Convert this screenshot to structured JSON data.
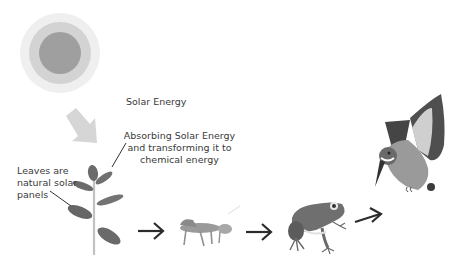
{
  "diagram": {
    "type": "food-chain",
    "labels": {
      "solar_energy": "Solar Energy",
      "absorbing_line1": "Absorbing Solar Energy",
      "absorbing_line2": "and transforming it to",
      "absorbing_line3": "chemical energy",
      "leaves_line1": "Leaves are",
      "leaves_line2": "natural solar",
      "leaves_line3": "panels"
    },
    "nodes": [
      {
        "id": "sun",
        "name": "Sun"
      },
      {
        "id": "plant",
        "name": "Plant"
      },
      {
        "id": "grasshopper",
        "name": "Grasshopper"
      },
      {
        "id": "frog",
        "name": "Frog"
      },
      {
        "id": "kingfisher",
        "name": "Kingfisher"
      }
    ],
    "edges": [
      {
        "from": "sun",
        "to": "plant"
      },
      {
        "from": "plant",
        "to": "grasshopper"
      },
      {
        "from": "grasshopper",
        "to": "frog"
      },
      {
        "from": "frog",
        "to": "kingfisher"
      }
    ],
    "colors": {
      "sun_outer": "#eeeeee",
      "sun_middle": "#d2d2d2",
      "sun_inner": "#9e9e9e",
      "sun_arrow": "#d6d6d6",
      "leaf": "#6a6a6a",
      "stem": "#bdbdbd",
      "arrow": "#2b2b2b"
    }
  }
}
